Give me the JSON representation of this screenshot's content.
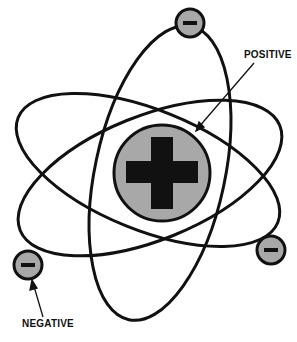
{
  "diagram": {
    "labels": {
      "positive": "POSITIVE",
      "negative": "NEGATIVE"
    },
    "nucleus": {
      "symbol": "+",
      "charge": "positive"
    },
    "electrons": [
      {
        "symbol": "−",
        "charge": "negative",
        "position": "top"
      },
      {
        "symbol": "−",
        "charge": "negative",
        "position": "left"
      },
      {
        "symbol": "−",
        "charge": "negative",
        "position": "right"
      }
    ],
    "colors": {
      "fill": "#a8a8a8",
      "stroke": "#111111"
    }
  }
}
